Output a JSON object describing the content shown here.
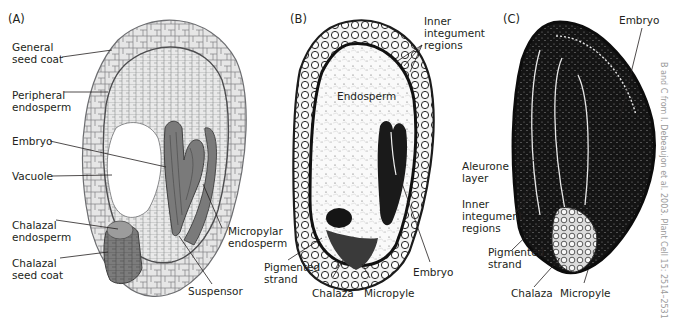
{
  "panels": [
    {
      "letter": "(A)",
      "labels": {
        "general_seed_coat": "General\nseed coat",
        "peripheral_endosperm": "Peripheral\nendosperm",
        "embryo": "Embryo",
        "vacuole": "Vacuole",
        "chalazal_endosperm": "Chalazal\nendosperm",
        "chalazal_seed_coat": "Chalazal\nseed coat",
        "micropylar_endosperm": "Micropylar\nendosperm",
        "suspensor": "Suspensor"
      }
    },
    {
      "letter": "(B)",
      "labels": {
        "inner_integument_regions": "Inner\nintegument\nregions",
        "endosperm": "Endosperm",
        "pigmented_strand": "Pigmented\nstrand",
        "chalaza": "Chalaza",
        "micropyle": "Micropyle",
        "embryo": "Embryo"
      }
    },
    {
      "letter": "(C)",
      "labels": {
        "embryo": "Embryo",
        "aleurone_layer": "Aleurone\nlayer",
        "inner_integument_regions": "Inner\nintegument\nregions",
        "pigmented_strand": "Pigmented\nstrand",
        "chalaza": "Chalaza",
        "micropyle": "Micropyle"
      }
    }
  ],
  "credit": "B and C from I. Debeaujon et al. 2003. Plant Cell 15: 2514–2531",
  "colors": {
    "cell_fill": "#e6e6e6",
    "cell_line": "#6d6e71",
    "tissue_dark": "#7a7a7a",
    "micrograph_dark": "#151515"
  }
}
